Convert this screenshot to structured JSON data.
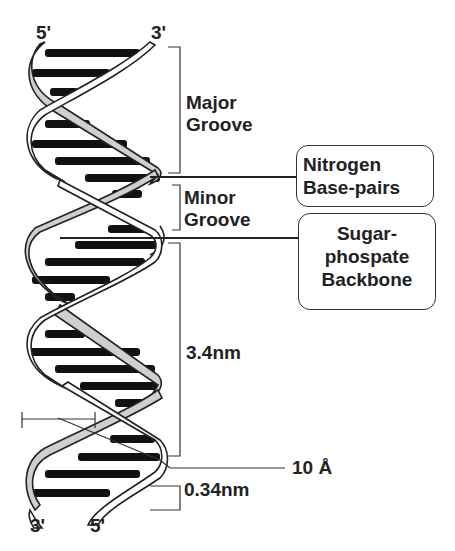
{
  "strand_ends": {
    "top_left": "5'",
    "top_right": "3'",
    "bottom_left": "3'",
    "bottom_right": "5'"
  },
  "labels": {
    "major_groove": [
      "Major",
      "Groove"
    ],
    "minor_groove": [
      "Minor",
      "Groove"
    ],
    "pitch": "3.4nm",
    "rise": "0.34nm",
    "diameter": "10 Å"
  },
  "callouts": {
    "base_pairs": [
      "Nitrogen",
      "Base-pairs"
    ],
    "backbone": [
      "Sugar-",
      "phospate",
      "Backbone"
    ]
  },
  "colors": {
    "strand_fill_shaded": "#cfcfcf",
    "strand_fill_white": "#ffffff",
    "outline": "#222222",
    "base_pair": "#111111"
  }
}
